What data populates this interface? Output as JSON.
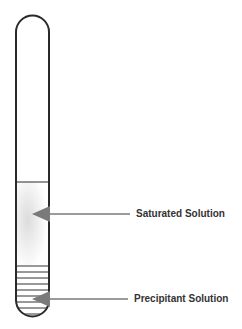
{
  "diagram": {
    "type": "test-tube",
    "labels": {
      "saturated": "Saturated Solution",
      "precipitant": "Precipitant Solution"
    },
    "colors": {
      "outline": "#2a2a2a",
      "arrow": "#7a7a7a",
      "hatch": "#333333",
      "text": "#333333"
    }
  }
}
